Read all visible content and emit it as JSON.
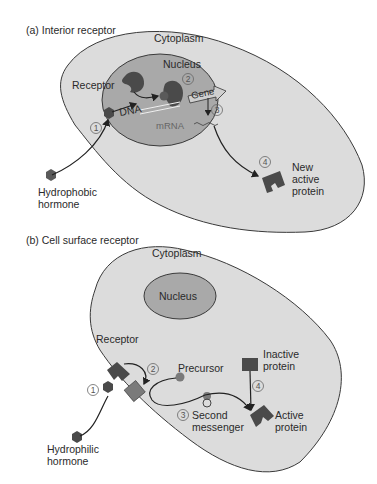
{
  "panel_a": {
    "title": "(a) Interior receptor",
    "cytoplasm": "Cytoplasm",
    "nucleus": "Nucleus",
    "receptor": "Receptor",
    "dna": "DNA",
    "gene": "Gene",
    "mrna": "mRNA",
    "hormone_line1": "Hydrophobic",
    "hormone_line2": "hormone",
    "protein_line1": "New",
    "protein_line2": "active",
    "protein_line3": "protein",
    "steps": [
      "1",
      "2",
      "3",
      "4"
    ]
  },
  "panel_b": {
    "title": "(b) Cell surface receptor",
    "cytoplasm": "Cytoplasm",
    "nucleus": "Nucleus",
    "receptor": "Receptor",
    "precursor": "Precursor",
    "inactive_line1": "Inactive",
    "inactive_line2": "protein",
    "messenger_line1": "Second",
    "messenger_line2": "messenger",
    "active_line1": "Active",
    "active_line2": "protein",
    "hormone_line1": "Hydrophilic",
    "hormone_line2": "hormone",
    "steps": [
      "1",
      "2",
      "3",
      "4"
    ]
  },
  "colors": {
    "cytoplasm": "#dcdcdc",
    "nucleus": "#a9a9a9",
    "outline": "#3a3a3a",
    "dark_shape": "#4a4a4a",
    "mid_shape": "#7a7a7a"
  }
}
